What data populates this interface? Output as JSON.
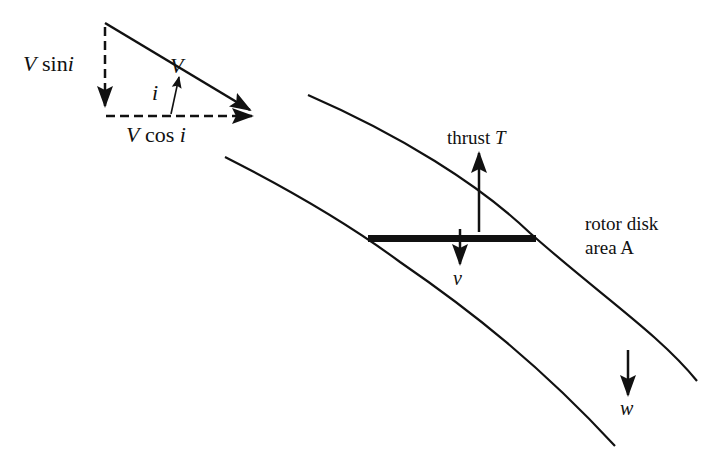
{
  "diagram": {
    "title": "",
    "colors": {
      "ink": "#111111",
      "background": "#ffffff"
    },
    "velocity_triangle": {
      "resultant_label": "V",
      "vertical_component": {
        "var": "V",
        "func": "sin",
        "arg": "i"
      },
      "horizontal_component": {
        "var": "V",
        "func": "cos",
        "arg": "i"
      },
      "angle_label": "i"
    },
    "labels": {
      "thrust_text": "thrust",
      "thrust_symbol": "T",
      "disk_line1": "rotor disk",
      "disk_line2": "area A",
      "induced_velocity": "v",
      "far_wake_velocity": "w"
    }
  }
}
